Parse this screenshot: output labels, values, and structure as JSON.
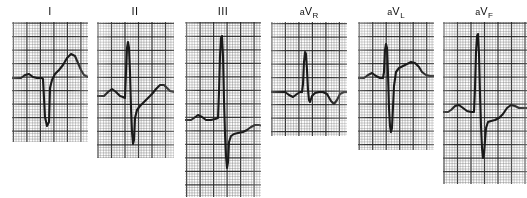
{
  "figure": {
    "background_color": "#ffffff",
    "ink_color": "#1a1a1a",
    "grid_fine_color": "#6e6e6e",
    "grid_bold_color": "#262626",
    "width": 527,
    "height": 198
  },
  "leads": [
    {
      "name": "lead-i",
      "label_prefix": "",
      "label_main": "I",
      "label_sub": "",
      "label_x": 50,
      "panel": {
        "x": 12,
        "y": 22,
        "w": 76,
        "h": 120
      },
      "grid": {
        "fine": 2.7,
        "bold_every": 5,
        "offset_x": 1.4,
        "offset_y": 1.0
      },
      "baseline_y": 56,
      "trace": "M 0,56 L 9,56 L 13,53 L 17,52 L 21,55 L 25,56 L 30,56 L 31,57 L 33,95 L 35,104 L 37,100 L 38,66 L 40,58 L 43,52 L 47,48 L 51,43 L 55,36 L 59,32 L 63,34 L 66,41 L 69,48 L 72,53 L 76,55 L 80,55 L 88,55"
    },
    {
      "name": "lead-ii",
      "label_prefix": "",
      "label_main": "II",
      "label_sub": "",
      "label_x": 135,
      "panel": {
        "x": 97,
        "y": 22,
        "w": 77,
        "h": 136
      },
      "grid": {
        "fine": 2.7,
        "bold_every": 5,
        "offset_x": 1.0,
        "offset_y": 1.3
      },
      "baseline_y": 74,
      "trace": "M 0,74 L 7,74 L 11,70 L 15,67 L 19,70 L 23,74 L 26,75 L 28,76 L 29,50 L 30,26 L 31,20 L 32,26 L 33,50 L 34,86 L 35,110 L 36,122 L 37,118 L 38,96 L 40,88 L 43,84 L 47,80 L 51,76 L 55,72 L 59,67 L 63,63 L 67,63 L 70,66 L 73,69 L 77,70 L 82,70 L 88,70"
    },
    {
      "name": "lead-iii",
      "label_prefix": "",
      "label_main": "III",
      "label_sub": "",
      "label_x": 223,
      "panel": {
        "x": 185,
        "y": 22,
        "w": 76,
        "h": 175
      },
      "grid": {
        "fine": 2.7,
        "bold_every": 5,
        "offset_x": 1.6,
        "offset_y": 0.8
      },
      "baseline_y": 98,
      "trace": "M 0,98 L 6,98 L 9,96 L 13,93 L 17,95 L 21,98 L 26,98 L 30,97 L 33,96 L 34,70 L 35,34 L 36,16 L 37,14 L 38,34 L 39,78 L 40,112 L 41,134 L 42,146 L 43,140 L 44,120 L 46,114 L 49,112 L 53,111 L 58,110 L 62,108 L 66,105 L 70,103 L 74,103 L 78,104 L 84,104"
    },
    {
      "name": "lead-avr",
      "label_prefix": "a",
      "label_main": "V",
      "label_sub": "R",
      "label_x": 309,
      "panel": {
        "x": 271,
        "y": 22,
        "w": 76,
        "h": 114
      },
      "grid": {
        "fine": 2.7,
        "bold_every": 5,
        "offset_x": 0.9,
        "offset_y": 1.5
      },
      "baseline_y": 70,
      "trace": "M 0,70 L 9,70 L 14,70 L 18,73 L 22,75 L 26,72 L 29,70 L 31,70 L 32,62 L 33,40 L 34,30 L 35,32 L 36,48 L 37,68 L 38,78 L 39,80 L 41,74 L 44,71 L 48,70 L 52,70 L 56,72 L 60,79 L 63,82 L 66,78 L 69,72 L 73,70 L 78,70 L 84,70"
    },
    {
      "name": "lead-avl",
      "label_prefix": "a",
      "label_main": "V",
      "label_sub": "L",
      "label_x": 396,
      "panel": {
        "x": 358,
        "y": 22,
        "w": 76,
        "h": 128
      },
      "grid": {
        "fine": 2.7,
        "bold_every": 5,
        "offset_x": 1.2,
        "offset_y": 1.1
      },
      "baseline_y": 56,
      "trace": "M 0,56 L 6,56 L 10,53 L 14,51 L 18,54 L 22,56 L 25,56 L 26,50 L 27,28 L 28,22 L 29,26 L 30,52 L 31,86 L 32,104 L 33,110 L 34,106 L 36,64 L 38,50 L 41,46 L 45,44 L 49,42 L 53,40 L 57,41 L 61,45 L 64,50 L 68,53 L 72,54 L 78,54 L 84,54"
    },
    {
      "name": "lead-avf",
      "label_prefix": "a",
      "label_main": "V",
      "label_sub": "F",
      "label_x": 484,
      "panel": {
        "x": 443,
        "y": 22,
        "w": 84,
        "h": 162
      },
      "grid": {
        "fine": 2.7,
        "bold_every": 5,
        "offset_x": 1.0,
        "offset_y": 1.2
      },
      "baseline_y": 90,
      "trace": "M 0,90 L 5,90 L 8,88 L 12,84 L 16,83 L 20,86 L 24,89 L 28,90 L 31,90 L 32,66 L 33,30 L 34,14 L 35,12 L 36,32 L 37,72 L 38,104 L 39,126 L 40,136 L 41,132 L 43,106 L 45,100 L 48,99 L 52,98 L 56,96 L 60,92 L 64,86 L 68,83 L 72,84 L 76,86 L 80,86 L 88,86"
    }
  ]
}
